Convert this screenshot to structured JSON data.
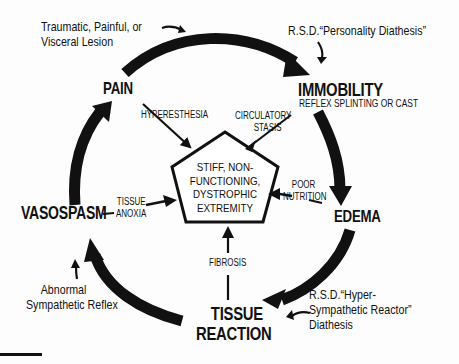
{
  "diagram": {
    "type": "cycle",
    "center": {
      "shape": "pentagon",
      "lines": [
        "STIFF, NON-",
        "FUNCTIONING,",
        "DYSTROPHIC",
        "EXTREMITY"
      ]
    },
    "nodes": {
      "pain": "PAIN",
      "immobility": "IMMOBILITY",
      "immobility_sub": "REFLEX SPLINTING OR CAST",
      "edema": "EDEMA",
      "tissue_reaction": [
        "TISSUE",
        "REACTION"
      ],
      "vasospasm": "VASOSPASM"
    },
    "connectors": {
      "hyperesthesia": "HYPERESTHESIA",
      "circulatory_stasis": [
        "CIRCULATORY",
        "STASIS"
      ],
      "poor_nutrition": [
        "POOR",
        "NUTRITION"
      ],
      "fibrosis": "FIBROSIS",
      "tissue_anoxia": [
        "TISSUE",
        "ANOXIA"
      ]
    },
    "annotations": {
      "lesion": [
        "Traumatic, Painful, or",
        "Visceral Lesion"
      ],
      "personality": "R.S.D.“Personality Diathesis”",
      "hyper_sympathetic": [
        "R.S.D.“Hyper-",
        "Sympathetic Reactor”",
        "Diathesis"
      ],
      "abnormal_reflex": [
        "Abnormal",
        "Sympathetic Reflex"
      ]
    },
    "cycle_order": [
      "PAIN",
      "IMMOBILITY",
      "EDEMA",
      "TISSUE REACTION",
      "VASOSPASM"
    ],
    "colors": {
      "ink": "#111111",
      "background": "#fdfdfd"
    }
  }
}
